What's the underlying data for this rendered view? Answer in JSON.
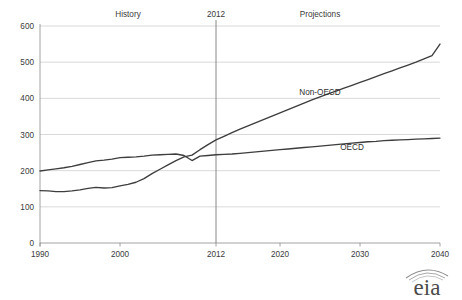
{
  "chart_data": {
    "type": "line",
    "title": "",
    "xlabel": "",
    "ylabel": "",
    "xlim": [
      1990,
      2040
    ],
    "ylim": [
      0,
      600
    ],
    "grid": true,
    "legend_position": "inline-annotation",
    "y_ticks": [
      "0",
      "100",
      "200",
      "300",
      "400",
      "500",
      "600"
    ],
    "y_tick_values": [
      0,
      100,
      200,
      300,
      400,
      500,
      600
    ],
    "x_ticks": [
      "1990",
      "2000",
      "2012",
      "2020",
      "2030",
      "2040"
    ],
    "x_tick_values": [
      1990,
      2000,
      2012,
      2020,
      2030,
      2040
    ],
    "annotations": [
      {
        "name": "history-label",
        "text": "History",
        "x": 2001,
        "y": 600
      },
      {
        "name": "projections-label",
        "text": "Projections",
        "x": 2025,
        "y": 600
      },
      {
        "name": "divider-year-label",
        "text": "2012",
        "x": 2012,
        "y": 600
      }
    ],
    "divider": {
      "x": 2012,
      "label": "2012"
    },
    "series": [
      {
        "name": "Non-OECD",
        "label_x": 2025,
        "label_y": 410,
        "x": [
          1990,
          1991,
          1992,
          1993,
          1994,
          1995,
          1996,
          1997,
          1998,
          1999,
          2000,
          2001,
          2002,
          2003,
          2004,
          2005,
          2006,
          2007,
          2008,
          2009,
          2010,
          2011,
          2012,
          2013,
          2014,
          2015,
          2016,
          2017,
          2018,
          2019,
          2020,
          2021,
          2022,
          2023,
          2024,
          2025,
          2026,
          2027,
          2028,
          2029,
          2030,
          2031,
          2032,
          2033,
          2034,
          2035,
          2036,
          2037,
          2038,
          2039,
          2040
        ],
        "values": [
          145,
          144,
          142,
          142,
          144,
          147,
          151,
          154,
          152,
          153,
          158,
          162,
          168,
          178,
          192,
          204,
          216,
          228,
          238,
          243,
          258,
          272,
          285,
          295,
          305,
          315,
          324,
          333,
          342,
          351,
          360,
          369,
          378,
          387,
          396,
          404,
          412,
          420,
          428,
          436,
          444,
          452,
          460,
          468,
          476,
          484,
          492,
          500,
          509,
          518,
          550
        ]
      },
      {
        "name": "OECD",
        "label_x": 2029,
        "label_y": 258,
        "x": [
          1990,
          1991,
          1992,
          1993,
          1994,
          1995,
          1996,
          1997,
          1998,
          1999,
          2000,
          2001,
          2002,
          2003,
          2004,
          2005,
          2006,
          2007,
          2008,
          2009,
          2010,
          2011,
          2012,
          2013,
          2014,
          2015,
          2016,
          2017,
          2018,
          2019,
          2020,
          2021,
          2022,
          2023,
          2024,
          2025,
          2026,
          2027,
          2028,
          2029,
          2030,
          2031,
          2032,
          2033,
          2034,
          2035,
          2036,
          2037,
          2038,
          2039,
          2040
        ],
        "values": [
          199,
          202,
          205,
          208,
          212,
          217,
          222,
          227,
          229,
          232,
          236,
          237,
          238,
          240,
          243,
          244,
          245,
          246,
          242,
          228,
          240,
          242,
          244,
          245,
          246,
          248,
          250,
          252,
          254,
          256,
          258,
          260,
          262,
          264,
          266,
          268,
          270,
          272,
          274,
          276,
          278,
          280,
          281,
          283,
          284,
          285,
          286,
          287,
          288,
          289,
          290
        ]
      }
    ]
  },
  "branding": {
    "logo_text": "eia",
    "logo_name": "eia-logo"
  }
}
